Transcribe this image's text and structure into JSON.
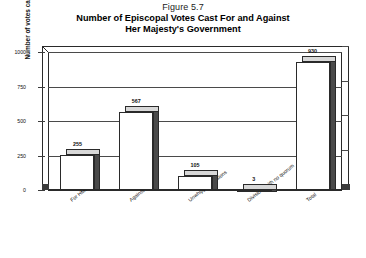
{
  "figure": {
    "caption": "Figure 5.7",
    "title_line1": "Number of Episcopal Votes Cast For and Against",
    "title_line2": "Her Majesty's Government"
  },
  "chart_data": {
    "type": "bar",
    "title": "Number of Episcopal Votes Cast For and Against Her Majesty's Government",
    "subtitle": "Figure 5.7",
    "xlabel": "",
    "ylabel": "Number of votes cast",
    "categories": [
      "For HMG",
      "Against HMG",
      "Unwhipped divisions",
      "Divisions with no quorum",
      "Total"
    ],
    "values": [
      255,
      567,
      105,
      3,
      930
    ],
    "data_labels": [
      "255",
      "567",
      "105",
      "3",
      "930"
    ],
    "ylim": [
      0,
      1000
    ],
    "yticks": [
      0,
      250,
      500,
      750,
      1000
    ],
    "ytick_labels": [
      "0",
      "250",
      "500",
      "750",
      "1000"
    ],
    "grid": true,
    "legend": false,
    "style": "3d-column",
    "colors": {
      "bar_face": "#ffffff",
      "bar_edge": "#2a2a2a",
      "bar_side": "#4a4a4a",
      "bar_top": "#d8d8d8",
      "gridline": "#4a4a4a",
      "text": "#111111",
      "background": "#ffffff"
    }
  }
}
